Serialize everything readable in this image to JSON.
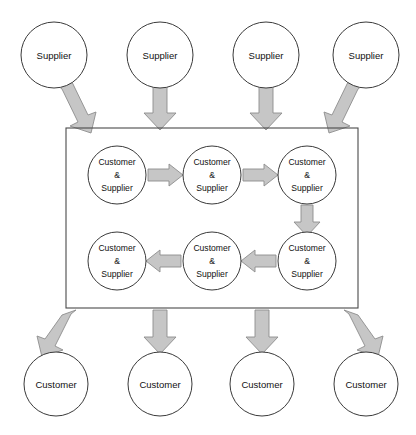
{
  "diagram": {
    "canvas": {
      "width": 416,
      "height": 435,
      "background": "#ffffff"
    },
    "styles": {
      "circle_fill": "#ffffff",
      "circle_stroke": "#3a3a3a",
      "box_stroke": "#4a4a4a",
      "arrow_fill": "#c6c6c6",
      "arrow_stroke": "#8d8d8d",
      "text_color": "#111111"
    },
    "labels": {
      "supplier": "Supplier",
      "customer": "Customer",
      "internal_line1": "Customer",
      "internal_line2": "&",
      "internal_line3": "Supplier"
    },
    "external_suppliers": [
      {
        "id": "supplier-1",
        "label": "Supplier",
        "cx": 54,
        "cy": 55,
        "r": 33
      },
      {
        "id": "supplier-2",
        "label": "Supplier",
        "cx": 160,
        "cy": 55,
        "r": 33
      },
      {
        "id": "supplier-3",
        "label": "Supplier",
        "cx": 266,
        "cy": 55,
        "r": 33
      },
      {
        "id": "supplier-4",
        "label": "Supplier",
        "cx": 366,
        "cy": 55,
        "r": 33
      }
    ],
    "external_customers": [
      {
        "id": "customer-1",
        "label": "Customer",
        "cx": 56,
        "cy": 384,
        "r": 32
      },
      {
        "id": "customer-2",
        "label": "Customer",
        "cx": 160,
        "cy": 384,
        "r": 32
      },
      {
        "id": "customer-3",
        "label": "Customer",
        "cx": 262,
        "cy": 384,
        "r": 32
      },
      {
        "id": "customer-4",
        "label": "Customer",
        "cx": 366,
        "cy": 384,
        "r": 32
      }
    ],
    "organization_box": {
      "x": 66,
      "y": 128,
      "width": 292,
      "height": 180
    },
    "internal_nodes": [
      {
        "id": "internal-1",
        "line1": "Customer",
        "line2": "&",
        "line3": "Supplier",
        "cx": 117,
        "cy": 175,
        "r": 29
      },
      {
        "id": "internal-2",
        "line1": "Customer",
        "line2": "&",
        "line3": "Supplier",
        "cx": 212,
        "cy": 175,
        "r": 29
      },
      {
        "id": "internal-3",
        "line1": "Customer",
        "line2": "&",
        "line3": "Supplier",
        "cx": 307,
        "cy": 175,
        "r": 29
      },
      {
        "id": "internal-4",
        "line1": "Customer",
        "line2": "&",
        "line3": "Supplier",
        "cx": 307,
        "cy": 261,
        "r": 29
      },
      {
        "id": "internal-5",
        "line1": "Customer",
        "line2": "&",
        "line3": "Supplier",
        "cx": 212,
        "cy": 261,
        "r": 29
      },
      {
        "id": "internal-6",
        "line1": "Customer",
        "line2": "&",
        "line3": "Supplier",
        "cx": 117,
        "cy": 261,
        "r": 29
      }
    ],
    "arrows": [
      {
        "id": "arrow-supplier-1-in",
        "from": "supplier-1",
        "to": "organization-box",
        "direction": "down-right"
      },
      {
        "id": "arrow-supplier-2-in",
        "from": "supplier-2",
        "to": "organization-box",
        "direction": "down"
      },
      {
        "id": "arrow-supplier-3-in",
        "from": "supplier-3",
        "to": "organization-box",
        "direction": "down"
      },
      {
        "id": "arrow-supplier-4-in",
        "from": "supplier-4",
        "to": "organization-box",
        "direction": "down-left"
      },
      {
        "id": "arrow-internal-1-2",
        "from": "internal-1",
        "to": "internal-2",
        "direction": "right"
      },
      {
        "id": "arrow-internal-2-3",
        "from": "internal-2",
        "to": "internal-3",
        "direction": "right"
      },
      {
        "id": "arrow-internal-3-4",
        "from": "internal-3",
        "to": "internal-4",
        "direction": "down"
      },
      {
        "id": "arrow-internal-4-5",
        "from": "internal-4",
        "to": "internal-5",
        "direction": "left"
      },
      {
        "id": "arrow-internal-5-6",
        "from": "internal-5",
        "to": "internal-6",
        "direction": "left"
      },
      {
        "id": "arrow-out-customer-1",
        "from": "organization-box",
        "to": "customer-1",
        "direction": "down-left"
      },
      {
        "id": "arrow-out-customer-2",
        "from": "organization-box",
        "to": "customer-2",
        "direction": "down"
      },
      {
        "id": "arrow-out-customer-3",
        "from": "organization-box",
        "to": "customer-3",
        "direction": "down"
      },
      {
        "id": "arrow-out-customer-4",
        "from": "organization-box",
        "to": "customer-4",
        "direction": "down-right"
      }
    ]
  }
}
